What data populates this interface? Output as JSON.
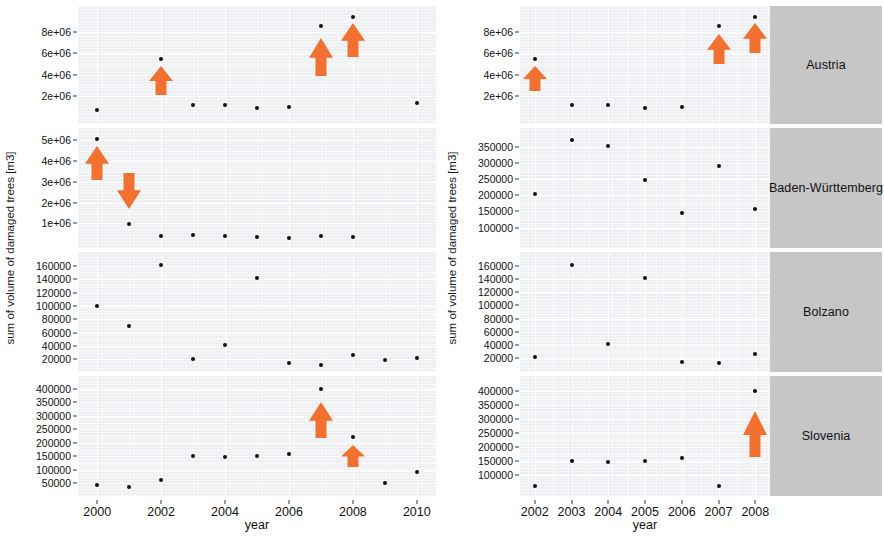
{
  "figure": {
    "y_axis_title": "sum of volume of damaged trees [m3]",
    "x_axis_title": "year",
    "accent_color": "#F4702E",
    "point_color": "#0d0d0d",
    "panel_bg": "#eceef1",
    "strip_bg": "#c6c6c6"
  },
  "chart_data": {
    "type": "scatter",
    "title": "",
    "subtitle": "",
    "xlabel": "year",
    "ylabel": "sum of volume of damaged trees [m3]",
    "grid": true,
    "legend": "none",
    "panels": [
      {
        "panel_id": "left",
        "xlim": [
          1999.4,
          2010.6
        ],
        "xticks": [
          "2000",
          "2002",
          "2004",
          "2006",
          "2008",
          "2010"
        ],
        "xtick_values": [
          2000,
          2002,
          2004,
          2006,
          2008,
          2010
        ],
        "facets": [
          {
            "name": "Austria",
            "strip_label_shown": false,
            "yticks": [
              "2e+06",
              "4e+06",
              "6e+06",
              "8e+06"
            ],
            "ytick_values": [
              2000000,
              4000000,
              6000000,
              8000000
            ],
            "ylim": [
              0,
              9800000
            ],
            "x": [
              2000,
              2002,
              2003,
              2004,
              2005,
              2006,
              2007,
              2008,
              2010
            ],
            "y": [
              700000,
              5500000,
              1250000,
              1250000,
              900000,
              1000000,
              8500000,
              9350000,
              1400000
            ],
            "annotations": [
              {
                "type": "arrow-up",
                "x": 2002,
                "y_from": 2000000,
                "y_to": 4900000
              },
              {
                "type": "arrow-up",
                "x": 2007,
                "y_from": 3800000,
                "y_to": 7500000
              },
              {
                "type": "arrow-up",
                "x": 2008,
                "y_from": 5600000,
                "y_to": 8900000
              }
            ]
          },
          {
            "name": "Baden-Württemberg",
            "strip_label_shown": false,
            "yticks": [
              "1e+06",
              "2e+06",
              "3e+06",
              "4e+06",
              "5e+06"
            ],
            "ytick_values": [
              1000000,
              2000000,
              3000000,
              4000000,
              5000000
            ],
            "ylim": [
              100000,
              5300000
            ],
            "x": [
              2000,
              2001,
              2002,
              2003,
              2004,
              2005,
              2006,
              2007,
              2008
            ],
            "y": [
              5050000,
              980000,
              370000,
              450000,
              380000,
              330000,
              300000,
              390000,
              360000
            ],
            "annotations": [
              {
                "type": "arrow-up",
                "x": 2000,
                "y_from": 3000000,
                "y_to": 4750000
              },
              {
                "type": "arrow-down",
                "x": 2001,
                "y_from": 3450000,
                "y_to": 1600000
              }
            ]
          },
          {
            "name": "Bolzano",
            "strip_label_shown": false,
            "yticks": [
              "20000",
              "40000",
              "60000",
              "80000",
              "100000",
              "120000",
              "140000",
              "160000"
            ],
            "ytick_values": [
              20000,
              40000,
              60000,
              80000,
              100000,
              120000,
              140000,
              160000
            ],
            "ylim": [
              10000,
              172000
            ],
            "x": [
              2000,
              2001,
              2002,
              2003,
              2004,
              2005,
              2006,
              2007,
              2008,
              2009,
              2010
            ],
            "y": [
              100000,
              70000,
              161000,
              20000,
              41000,
              142000,
              14000,
              12000,
              26000,
              19000,
              22000
            ],
            "annotations": []
          },
          {
            "name": "Slovenia",
            "strip_label_shown": false,
            "yticks": [
              "50000",
              "100000",
              "150000",
              "200000",
              "250000",
              "300000",
              "350000",
              "400000"
            ],
            "ytick_values": [
              50000,
              100000,
              150000,
              200000,
              250000,
              300000,
              350000,
              400000
            ],
            "ylim": [
              25000,
              425000
            ],
            "x": [
              2000,
              2001,
              2002,
              2003,
              2004,
              2005,
              2006,
              2007,
              2008,
              2009,
              2010
            ],
            "y": [
              45000,
              38000,
              62000,
              150000,
              148000,
              152000,
              160000,
              400000,
              222000,
              52000,
              92000
            ],
            "annotations": [
              {
                "type": "arrow-up",
                "x": 2007,
                "y_from": 215000,
                "y_to": 355000
              },
              {
                "type": "arrow-up",
                "x": 2008,
                "y_from": 105000,
                "y_to": 195000
              }
            ]
          }
        ]
      },
      {
        "panel_id": "right",
        "xlim": [
          2001.6,
          2008.4
        ],
        "xticks": [
          "2002",
          "2003",
          "2004",
          "2005",
          "2006",
          "2007",
          "2008"
        ],
        "xtick_values": [
          2002,
          2003,
          2004,
          2005,
          2006,
          2007,
          2008
        ],
        "facets": [
          {
            "name": "Austria",
            "strip_label_shown": true,
            "yticks": [
              "2e+06",
              "4e+06",
              "6e+06",
              "8e+06"
            ],
            "ytick_values": [
              2000000,
              4000000,
              6000000,
              8000000
            ],
            "ylim": [
              0,
              9800000
            ],
            "x": [
              2002,
              2003,
              2004,
              2005,
              2006,
              2007,
              2008
            ],
            "y": [
              5500000,
              1250000,
              1250000,
              900000,
              1000000,
              8500000,
              9350000
            ],
            "annotations": [
              {
                "type": "arrow-up",
                "x": 2002,
                "y_from": 2400000,
                "y_to": 4900000
              },
              {
                "type": "arrow-up",
                "x": 2007,
                "y_from": 4900000,
                "y_to": 7900000
              },
              {
                "type": "arrow-up",
                "x": 2008,
                "y_from": 5900000,
                "y_to": 8900000
              }
            ]
          },
          {
            "name": "Baden-Württemberg",
            "strip_label_shown": true,
            "yticks": [
              "100000",
              "150000",
              "200000",
              "250000",
              "300000",
              "350000"
            ],
            "ytick_values": [
              100000,
              150000,
              200000,
              250000,
              300000,
              350000
            ],
            "ylim": [
              55000,
              390000
            ],
            "x": [
              2002,
              2003,
              2004,
              2005,
              2006,
              2007,
              2008
            ],
            "y": [
              205000,
              371000,
              352000,
              248000,
              145000,
              292000,
              158000
            ],
            "annotations": []
          },
          {
            "name": "Bolzano",
            "strip_label_shown": true,
            "yticks": [
              "20000",
              "40000",
              "60000",
              "80000",
              "100000",
              "120000",
              "140000",
              "160000"
            ],
            "ytick_values": [
              20000,
              40000,
              60000,
              80000,
              100000,
              120000,
              140000,
              160000
            ],
            "ylim": [
              8000,
              172000
            ],
            "x": [
              2002,
              2003,
              2004,
              2005,
              2006,
              2007,
              2008
            ],
            "y": [
              22000,
              161000,
              41000,
              142000,
              14000,
              12000,
              26000
            ],
            "annotations": []
          },
          {
            "name": "Slovenia",
            "strip_label_shown": true,
            "yticks": [
              "100000",
              "150000",
              "200000",
              "250000",
              "300000",
              "350000",
              "400000"
            ],
            "ytick_values": [
              100000,
              150000,
              200000,
              250000,
              300000,
              350000,
              400000
            ],
            "ylim": [
              48000,
              430000
            ],
            "x": [
              2002,
              2003,
              2004,
              2005,
              2006,
              2007,
              2008
            ],
            "y": [
              62000,
              150000,
              148000,
              152000,
              160000,
              62000,
              400000
            ],
            "annotations": [
              {
                "type": "arrow-up",
                "x": 2008,
                "y_from": 160000,
                "y_to": 330000
              }
            ]
          }
        ]
      }
    ]
  }
}
